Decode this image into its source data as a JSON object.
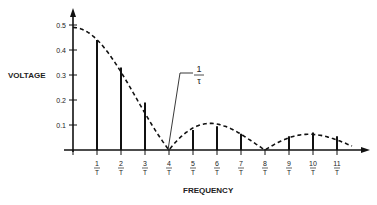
{
  "chart_data": {
    "type": "bar",
    "title": "",
    "xlabel": "FREQUENCY",
    "ylabel": "VOLTAGE",
    "ylim": [
      0,
      0.5
    ],
    "yticks": [
      "0.1",
      "0.2",
      "0.3",
      "0.4",
      "0.5"
    ],
    "categories": [
      "1/T",
      "2/T",
      "3/T",
      "4/T",
      "5/T",
      "6/T",
      "7/T",
      "8/T",
      "9/T",
      "10/T",
      "11/T"
    ],
    "values": [
      0.44,
      0.33,
      0.19,
      0.0,
      0.08,
      0.095,
      0.065,
      0.0,
      0.055,
      0.07,
      0.055
    ],
    "envelope": {
      "style": "dashed",
      "description": "sinc-shaped envelope starting at 0.5, zeros at 4/T and 8/T"
    },
    "annotation": {
      "text_num": "1",
      "text_den": "τ",
      "points_to": "4/T"
    },
    "grid": false,
    "legend": null
  },
  "labels": {
    "ylabel": "VOLTAGE",
    "xlabel": "FREQUENCY",
    "annotation_num": "1",
    "annotation_den": "τ",
    "tick_den": "T"
  }
}
